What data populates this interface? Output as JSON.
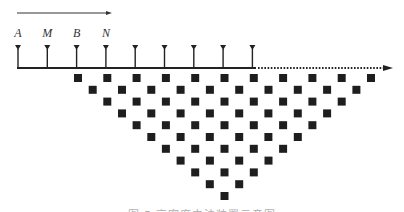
{
  "diagram": {
    "type": "resistivity-survey-array-schematic",
    "direction_arrow": {
      "x1": 17,
      "x2": 112,
      "y": 13,
      "label": ""
    },
    "electrode_labels": [
      "A",
      "M",
      "B",
      "N"
    ],
    "electrodes": {
      "count": 9,
      "x_start": 18,
      "spacing": 29.3,
      "triangle_top_y": 45,
      "line_y": 68
    },
    "cable_line": {
      "x1": 17,
      "x2": 256,
      "y": 68,
      "style": "solid"
    },
    "extension_line": {
      "x1": 256,
      "x2": 393,
      "y": 68,
      "style": "dotted",
      "arrow": true
    },
    "measurement_points": {
      "rows": 11,
      "first_row_count": 11,
      "x_start": 78,
      "x_spacing": 29.3,
      "y_start": 78,
      "y_spacing": 11.8,
      "square_size": 8,
      "shape": "inverted-triangle (pseudo-section)"
    },
    "colors": {
      "line": "#222222",
      "marker": "#1e1e1e",
      "label": "#333333",
      "arrow": "#333333"
    }
  },
  "caption": {
    "text": "图 5  高密度电法装置示意图",
    "visibility": "clipped at bottom edge"
  }
}
